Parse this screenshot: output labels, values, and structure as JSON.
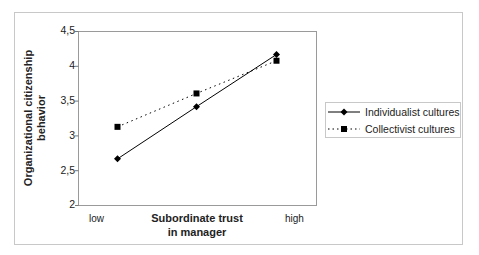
{
  "chart_data": {
    "type": "line",
    "title": "",
    "xlabel": "Subordinate trust in manager",
    "xlabel_lines": [
      "Subordinate trust",
      "in manager"
    ],
    "ylabel": "Organizational citizenship behavior",
    "ylabel_lines": [
      "Organizational citizenship",
      "behavior"
    ],
    "x_tick_labels": [
      "low",
      "high"
    ],
    "x": [
      "low",
      "medium",
      "high"
    ],
    "ylim": [
      2,
      4.5
    ],
    "y_ticks": [
      "2",
      "2,5",
      "3",
      "3,5",
      "4",
      "4,5"
    ],
    "grid": false,
    "legend_position": "right",
    "series": [
      {
        "name": "Individualist cultures",
        "values": [
          2.67,
          3.42,
          4.17
        ],
        "line_style": "solid",
        "marker": "diamond",
        "color": "#000000"
      },
      {
        "name": "Collectivist cultures",
        "values": [
          3.13,
          3.61,
          4.08
        ],
        "line_style": "dotted",
        "marker": "square",
        "color": "#000000"
      }
    ]
  },
  "labels": {
    "y_ticks": [
      "4,5",
      "4",
      "3,5",
      "3",
      "2,5",
      "2"
    ],
    "x_low": "low",
    "x_high": "high",
    "xlabel_line1": "Subordinate trust",
    "xlabel_line2": "in manager",
    "ylabel_line1": "Organizational citizenship",
    "ylabel_line2": "behavior",
    "legend_individualist": "Individualist cultures",
    "legend_collectivist": "Collectivist cultures"
  }
}
